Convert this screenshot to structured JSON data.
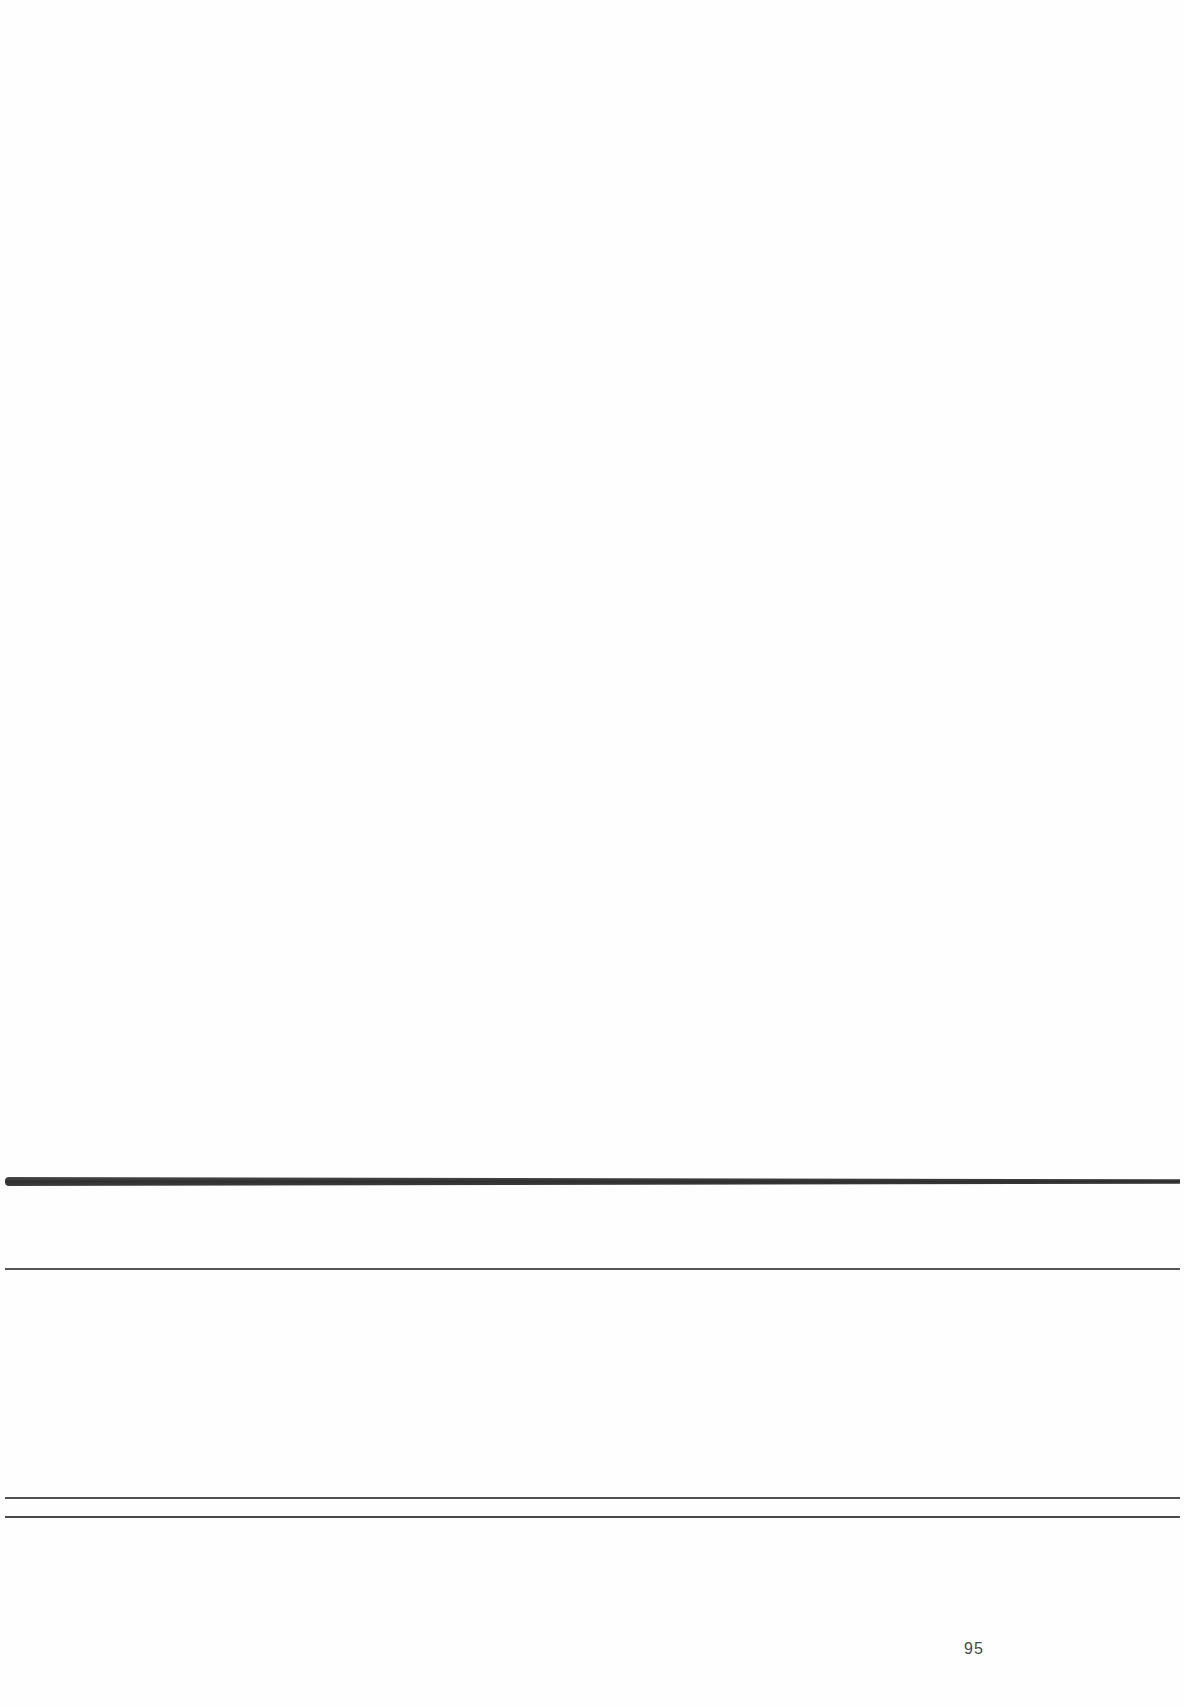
{
  "document": {
    "page_number": "95",
    "rules": [
      {
        "kind": "thick",
        "y": 1181
      },
      {
        "kind": "thin",
        "y": 1269
      },
      {
        "kind": "thin",
        "y": 1498
      },
      {
        "kind": "thin",
        "y": 1517
      }
    ],
    "colors": {
      "background": "#fefefe",
      "rule": "#333333",
      "text": "#4a4a4a"
    }
  }
}
